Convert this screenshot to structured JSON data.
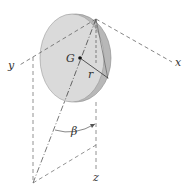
{
  "diagram": {
    "labels": {
      "x_axis": "x",
      "y_axis": "y",
      "z_axis": "z",
      "center": "G",
      "radius": "r",
      "angle": "β"
    },
    "colors": {
      "disc_face": "#d9d9d9",
      "disc_rim": "#bdbdbd",
      "line": "#444444",
      "dashed": "#666666"
    }
  }
}
